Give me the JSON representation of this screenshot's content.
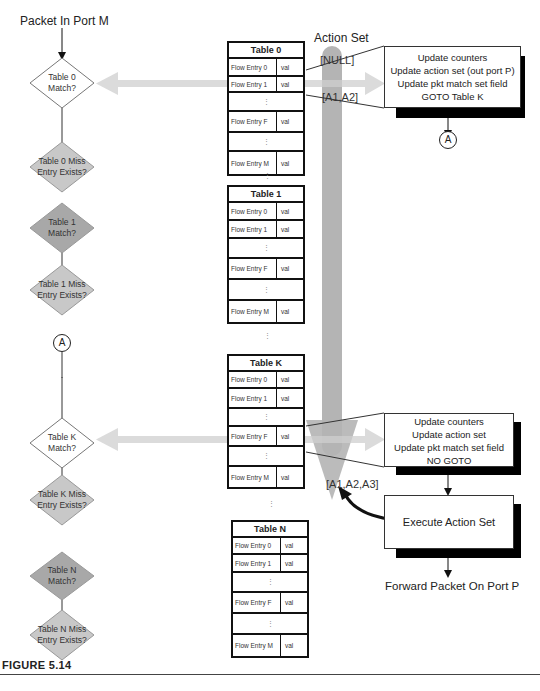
{
  "diagram": {
    "start_label": "Packet In Port M",
    "action_set_title": "Action Set",
    "action_set_states": [
      "[NULL]",
      "[A1,A2]",
      "[A1,A2,A3]"
    ],
    "connector_label": "A",
    "figure_label": "FIGURE 5.14",
    "colors": {
      "match_diamond_active": "#ffffff",
      "match_diamond_inactive": "#a8a8a8",
      "miss_diamond": "#c8c8c8",
      "flow_arrow": "#d0d0d0",
      "action_bar": "#b4b4b4",
      "shadow": "#000000"
    },
    "decisions": [
      {
        "id": "t0-match",
        "label": "Table 0\nMatch?",
        "line1": "Table 0",
        "line2": "Match?",
        "state": "active"
      },
      {
        "id": "t0-miss",
        "line1": "Table 0 Miss",
        "line2": "Entry Exists?"
      },
      {
        "id": "t1-match",
        "line1": "Table 1",
        "line2": "Match?",
        "state": "inactive"
      },
      {
        "id": "t1-miss",
        "line1": "Table 1 Miss",
        "line2": "Entry Exists?"
      },
      {
        "id": "tk-match",
        "line1": "Table K",
        "line2": "Match?",
        "state": "active"
      },
      {
        "id": "tk-miss",
        "line1": "Table K Miss",
        "line2": "Entry Exists?"
      },
      {
        "id": "tn-match",
        "line1": "Table N",
        "line2": "Match?",
        "state": "inactive"
      },
      {
        "id": "tn-miss",
        "line1": "Table N Miss",
        "line2": "Entry Exists?"
      }
    ],
    "tables": [
      {
        "title": "Table 0",
        "rows": [
          {
            "key": "Flow Entry 0",
            "val": "val"
          },
          {
            "key": "Flow Entry 1",
            "val": "val"
          },
          {
            "dots": "⋮"
          },
          {
            "key": "Flow Entry F",
            "val": "val"
          },
          {
            "dots": "⋮"
          },
          {
            "key": "Flow Entry M",
            "val": "val"
          }
        ]
      },
      {
        "title": "Table 1",
        "rows": [
          {
            "key": "Flow Entry 0",
            "val": "val"
          },
          {
            "key": "Flow Entry 1",
            "val": "val"
          },
          {
            "dots": "⋮"
          },
          {
            "key": "Flow Entry F",
            "val": "val"
          },
          {
            "dots": "⋮"
          },
          {
            "key": "Flow Entry M",
            "val": "val"
          }
        ]
      },
      {
        "title": "Table K",
        "rows": [
          {
            "key": "Flow Entry 0",
            "val": "val"
          },
          {
            "key": "Flow Entry 1",
            "val": "val"
          },
          {
            "dots": "⋮"
          },
          {
            "key": "Flow Entry F",
            "val": "val"
          },
          {
            "dots": "⋮"
          },
          {
            "key": "Flow Entry M",
            "val": "val"
          }
        ]
      },
      {
        "title": "Table N",
        "rows": [
          {
            "key": "Flow Entry 0",
            "val": "val"
          },
          {
            "key": "Flow Entry 1",
            "val": "val"
          },
          {
            "dots": "⋮"
          },
          {
            "key": "Flow Entry F",
            "val": "val"
          },
          {
            "dots": "⋮"
          },
          {
            "key": "Flow Entry M",
            "val": "val"
          }
        ]
      }
    ],
    "between_tables_dots": "⋮",
    "callouts": [
      {
        "id": "table0-instructions",
        "lines": [
          "Update counters",
          "Update action set (out port P)",
          "Update pkt match set field",
          "GOTO Table K"
        ]
      },
      {
        "id": "tablek-instructions",
        "lines": [
          "Update counters",
          "Update action set",
          "Update pkt match set field",
          "NO GOTO"
        ]
      }
    ],
    "execute_label": "Execute Action Set",
    "forward_label": "Forward Packet On Port P"
  }
}
